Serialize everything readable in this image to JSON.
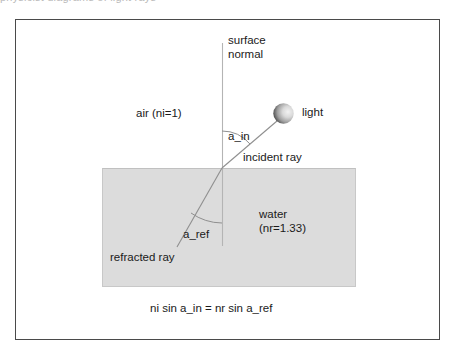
{
  "figure": {
    "clipped_top_text": "physicist  diagrams  of  light  rays",
    "labels": {
      "surface_normal": "surface\nnormal",
      "air": "air (ni=1)",
      "light": "light",
      "angle_incidence": "a_in",
      "incident_ray": "incident ray",
      "water": "water\n(nr=1.33)",
      "angle_refraction": "a_ref",
      "refracted_ray": "refracted ray",
      "equation": "ni sin a_in = nr sin a_ref"
    },
    "values": {
      "refractive_index_air": "1",
      "refractive_index_water": "1.33"
    },
    "colors": {
      "frame_stroke": "#4a4a4a",
      "water_fill": "#dcdcdc",
      "water_stroke": "#c4c4c4",
      "ray_stroke": "#8a8a8a",
      "normal_stroke": "#b0b0b0",
      "light_dark": "#1c1c1c",
      "light_light": "#e8e8e8",
      "text": "#1a1a1a",
      "background": "#ffffff"
    },
    "geometry": {
      "water_rect": {
        "x": 102,
        "y": 168,
        "width": 254,
        "height": 119
      },
      "interface_point": {
        "x": 222,
        "y": 168
      },
      "normal_line": {
        "x": 222,
        "y_top": 43,
        "y_bottom": 246
      },
      "incident_ray": {
        "x1": 283,
        "y1": 114,
        "x2": 222,
        "y2": 168
      },
      "refracted_ray": {
        "x1": 222,
        "y1": 168,
        "x2": 178,
        "y2": 246
      },
      "light_sphere": {
        "cx": 283,
        "cy": 113,
        "r": 10
      }
    }
  }
}
